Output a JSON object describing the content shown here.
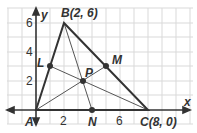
{
  "diagram": {
    "type": "coordinate-triangle-medians",
    "axes": {
      "x_label": "x",
      "y_label": "y"
    },
    "x_ticks": [
      "2",
      "6"
    ],
    "y_ticks": [
      "2",
      "4",
      "6"
    ],
    "points": {
      "A": {
        "label": "A"
      },
      "B": {
        "label": "B(2, 6)"
      },
      "C": {
        "label": "C(8, 0)"
      },
      "L": {
        "label": "L"
      },
      "M": {
        "label": "M"
      },
      "N": {
        "label": "N"
      },
      "P": {
        "label": "P"
      }
    },
    "colors": {
      "grid": "#d8d8d8",
      "lines": "#333333",
      "axis": "#333333"
    }
  }
}
